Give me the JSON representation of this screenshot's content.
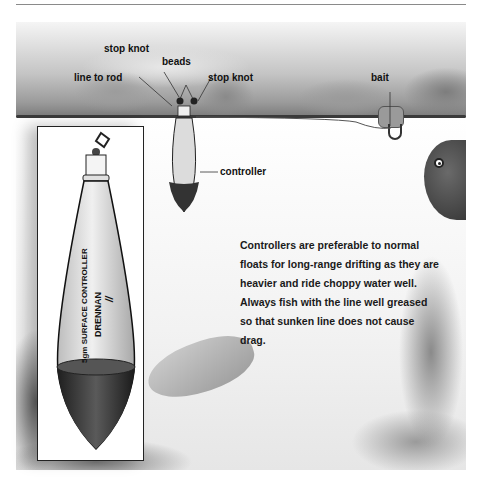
{
  "header": {
    "title": ""
  },
  "diagram": {
    "labels": {
      "stop_knot_top": "stop knot",
      "beads": "beads",
      "line_to_rod": "line to rod",
      "stop_knot_right": "stop knot",
      "bait": "bait",
      "controller": "controller"
    },
    "body_text": "Controllers are preferable to normal floats for long-range drifting as they are heavier and ride choppy water well. Always fish with the line well greased so that sunken line does not cause drag.",
    "inset": {
      "float_text_line1": "5gm SURFACE CONTROLLER",
      "float_brand": "DRENNAN",
      "float_mark": "//"
    },
    "colors": {
      "ink": "#111111",
      "water_line": "#3a3a3a",
      "float_body": "#d9d9d9",
      "float_weight": "#2a2a2a"
    }
  }
}
